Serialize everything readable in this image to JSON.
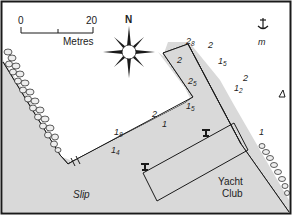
{
  "map": {
    "type": "harbour-plan",
    "colors": {
      "land": "#d9d9d9",
      "water": "#ffffff",
      "outline": "#1a1a1a",
      "rocks": "#e8e8e8"
    },
    "scale_bar": {
      "start_label": "0",
      "end_label": "20",
      "unit_label": "Metres"
    },
    "north_label": "N",
    "labels": {
      "slip": "Slip",
      "yacht_club_line1": "Yacht",
      "yacht_club_line2": "Club",
      "mooring": "m"
    },
    "depths": [
      {
        "id": "d1",
        "main": "2",
        "sub": "8"
      },
      {
        "id": "d2",
        "main": "2",
        "sub": ""
      },
      {
        "id": "d3",
        "main": "2",
        "sub": ""
      },
      {
        "id": "d4",
        "main": "1",
        "sub": "5"
      },
      {
        "id": "d5",
        "main": "2",
        "sub": "5"
      },
      {
        "id": "d6",
        "main": "2",
        "sub": ""
      },
      {
        "id": "d7",
        "main": "1",
        "sub": "2"
      },
      {
        "id": "d8",
        "main": "1",
        "sub": "5"
      },
      {
        "id": "d9",
        "main": "2",
        "sub": ""
      },
      {
        "id": "d10",
        "main": "1",
        "sub": ""
      },
      {
        "id": "d11",
        "main": "1",
        "sub": "8"
      },
      {
        "id": "d12",
        "main": "1",
        "sub": "4"
      },
      {
        "id": "d13",
        "main": "1",
        "sub": ""
      }
    ],
    "symbols": [
      "anchorage-icon",
      "hazard-triangle-icon",
      "water-tap-icon",
      "water-tap-icon",
      "compass-rose-icon"
    ]
  }
}
